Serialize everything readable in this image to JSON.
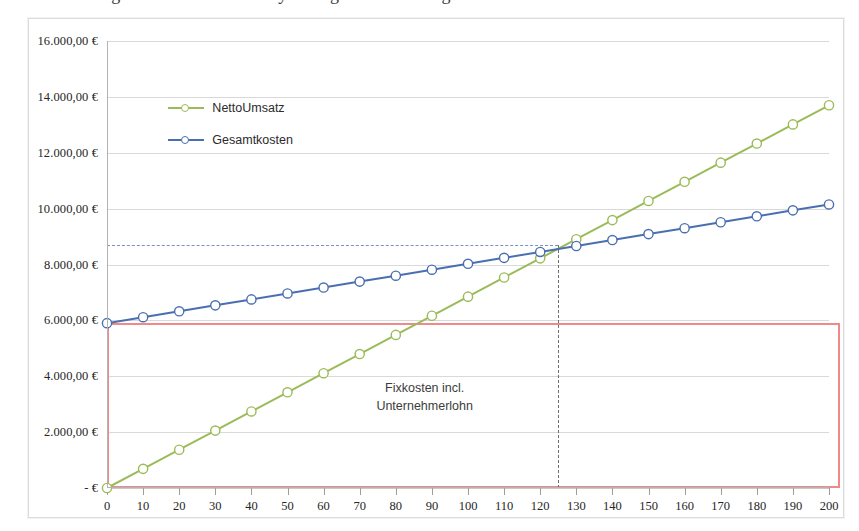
{
  "page": {
    "cropped_top_text": "Abbildung 1: Break-Even-Analyse Gegenüberstellung Umsatz und Kosten"
  },
  "legend": {
    "position": "top-left-inside",
    "items": [
      {
        "label": "NettoUmsatz",
        "color": "#9BBB59",
        "marker": "circle"
      },
      {
        "label": "Gesamtkosten",
        "color": "#4A6FB0",
        "marker": "circle"
      }
    ]
  },
  "annotation": {
    "line1": "Fixkosten incl.",
    "line2": "Unternehmerlohn"
  },
  "colors": {
    "netto_umsatz": "#9BBB59",
    "gesamtkosten": "#4A6FB0",
    "fixkosten_box": "#F08A8A",
    "guide_horizontal": "#7A93C4",
    "guide_vertical": "#6E6E6E",
    "grid": "#D9D9D9",
    "axis": "#B3B3B3"
  },
  "chart_data": {
    "type": "line",
    "title": "",
    "xlabel": "",
    "ylabel": "",
    "grid": true,
    "legend_position": "top-left-inside",
    "x": [
      0,
      10,
      20,
      30,
      40,
      50,
      60,
      70,
      80,
      90,
      100,
      110,
      120,
      130,
      140,
      150,
      160,
      170,
      180,
      190,
      200
    ],
    "xlim": [
      0,
      200
    ],
    "xticks": [
      0,
      10,
      20,
      30,
      40,
      50,
      60,
      70,
      80,
      90,
      100,
      110,
      120,
      130,
      140,
      150,
      160,
      170,
      180,
      190,
      200
    ],
    "xticklabels": [
      "0",
      "10",
      "20",
      "30",
      "40",
      "50",
      "60",
      "70",
      "80",
      "90",
      "100",
      "110",
      "120",
      "130",
      "140",
      "150",
      "160",
      "170",
      "180",
      "190",
      "200"
    ],
    "ylim": [
      0,
      16000
    ],
    "yticks": [
      0,
      2000,
      4000,
      6000,
      8000,
      10000,
      12000,
      14000,
      16000
    ],
    "yticklabels": [
      "- €",
      "2.000,00 €",
      "4.000,00 €",
      "6.000,00 €",
      "8.000,00 €",
      "10.000,00 €",
      "12.000,00 €",
      "14.000,00 €",
      "16.000,00 €"
    ],
    "series": [
      {
        "name": "NettoUmsatz",
        "color": "#9BBB59",
        "values": [
          0,
          685,
          1370,
          2055,
          2740,
          3425,
          4110,
          4795,
          5480,
          6165,
          6850,
          7535,
          8220,
          8905,
          9590,
          10275,
          10960,
          11645,
          12330,
          13015,
          13700
        ]
      },
      {
        "name": "Gesamtkosten",
        "color": "#4A6FB0",
        "values": [
          5900,
          6113,
          6325,
          6538,
          6750,
          6963,
          7175,
          7388,
          7600,
          7813,
          8025,
          8238,
          8450,
          8663,
          8875,
          9088,
          9300,
          9513,
          9725,
          9938,
          10150
        ]
      }
    ],
    "annotations": [
      {
        "type": "rect",
        "name": "fixkosten-box",
        "label": "Fixkosten incl. Unternehmerlohn",
        "x0": 0,
        "x1": 203,
        "y0": 0,
        "y1": 5900,
        "color": "#F08A8A"
      },
      {
        "type": "hline",
        "name": "break-even-horizontal-guide",
        "y": 8700,
        "x0": 0,
        "x1": 125,
        "style": "dashed",
        "color": "#7A93C4"
      },
      {
        "type": "vline",
        "name": "break-even-vertical-guide",
        "x": 125,
        "y0": 0,
        "y1": 8700,
        "style": "dashed",
        "color": "#6E6E6E"
      },
      {
        "type": "text",
        "name": "fixkosten-annotation",
        "text": "Fixkosten incl.\nUnternehmerlohn",
        "x": 88,
        "y": 3250
      }
    ],
    "break_even": {
      "x": 125,
      "y": 8700
    }
  }
}
